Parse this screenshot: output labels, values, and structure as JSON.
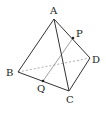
{
  "diagram": {
    "vertices": {
      "A": {
        "label": "A",
        "x": 54,
        "y": 19,
        "lx": 50,
        "ly": 14
      },
      "B": {
        "label": "B",
        "x": 18,
        "y": 72,
        "lx": 6,
        "ly": 76
      },
      "C": {
        "label": "C",
        "x": 69,
        "y": 91,
        "lx": 66,
        "ly": 103
      },
      "D": {
        "label": "D",
        "x": 90,
        "y": 58,
        "lx": 92,
        "ly": 63
      }
    },
    "points": {
      "P": {
        "label": "P",
        "x": 73,
        "y": 38,
        "lx": 76,
        "ly": 37
      },
      "Q": {
        "label": "Q",
        "x": 43,
        "y": 81,
        "lx": 37,
        "ly": 92
      }
    },
    "edges_solid": [
      "AB",
      "AC",
      "AD",
      "BC",
      "CD"
    ],
    "edges_dashed": [
      "BD"
    ],
    "segments": [
      "PQ"
    ],
    "colors": {
      "edge": "#333333",
      "dashed": "#999999",
      "segment": "#888888",
      "point": "#222222"
    }
  }
}
